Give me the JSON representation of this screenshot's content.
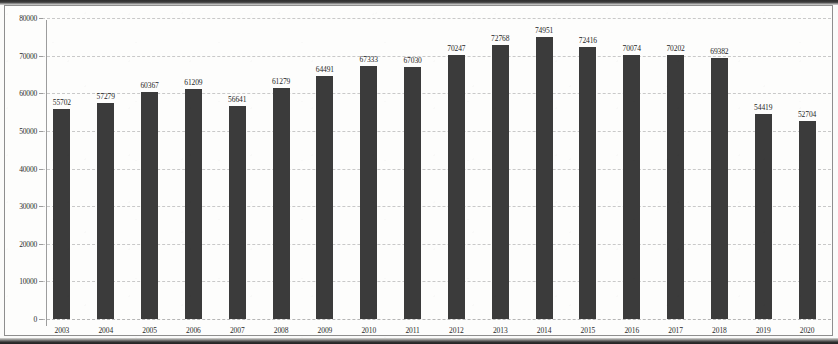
{
  "chart_data": {
    "type": "bar",
    "title": "",
    "subtitle": "",
    "xlabel": "",
    "ylabel": "",
    "categories": [
      "2003",
      "2004",
      "2005",
      "2006",
      "2007",
      "2008",
      "2009",
      "2010",
      "2011",
      "2012",
      "2013",
      "2014",
      "2015",
      "2016",
      "2017",
      "2018",
      "2019",
      "2020"
    ],
    "values": [
      55702,
      57279,
      60367,
      61209,
      56641,
      61279,
      64491,
      67333,
      67030,
      70247,
      72768,
      74951,
      72416,
      70074,
      70202,
      69382,
      54419,
      52704
    ],
    "data_labels": [
      "55702",
      "57279",
      "60367",
      "61209",
      "56641",
      "61279",
      "64491",
      "67333",
      "67030",
      "70247",
      "72768",
      "74951",
      "72416",
      "70074",
      "70202",
      "69382",
      "54419",
      "52704"
    ],
    "ylim": [
      0,
      80000
    ],
    "ytick_values": [
      0,
      10000,
      20000,
      30000,
      40000,
      50000,
      60000,
      70000,
      80000
    ],
    "ytick_labels": [
      "0",
      "10000",
      "20000",
      "30000",
      "40000",
      "50000",
      "60000",
      "70000",
      "80000"
    ],
    "ytick_step": 10000,
    "grid": true,
    "grid_style": "dashed",
    "legend": false,
    "legend_position": "none",
    "series": [
      {
        "name": "",
        "values": [
          55702,
          57279,
          60367,
          61209,
          56641,
          61279,
          64491,
          67333,
          67030,
          70247,
          72768,
          74951,
          72416,
          70074,
          70202,
          69382,
          54419,
          52704
        ],
        "color": "#3b3b3b"
      }
    ],
    "colors": {
      "bar": "#3b3b3b",
      "gridline": "#c9c9c9",
      "axis": "#9d9d9d",
      "text": "#1f1f1f",
      "background": "#fdfdfc",
      "frame": "#8e8e8e"
    }
  }
}
